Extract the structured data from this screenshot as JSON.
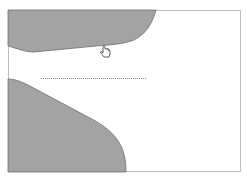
{
  "canvas": {
    "background": "#ffffff",
    "frame_color": "#bdbdbd",
    "shape_fill": "#a3a3a3",
    "shape_stroke": "#6e6e6e",
    "dotted_line_color": "#8a8a8a"
  },
  "shapes": [
    {
      "name": "top-left-gray-region"
    },
    {
      "name": "bottom-left-gray-region"
    }
  ],
  "cursor": {
    "type": "hand-pointer-icon"
  }
}
